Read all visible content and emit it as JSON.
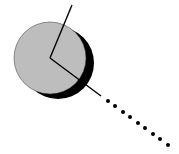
{
  "diagram": {
    "colors": {
      "background": "#ffffff",
      "disc_fill": "#bdbdbd",
      "disc_stroke": "#333333",
      "shadow": "#000000",
      "line": "#000000"
    },
    "disc": {
      "cx": 50,
      "cy": 58,
      "r": 36
    },
    "shadow": {
      "cx": 58,
      "cy": 63,
      "r": 36
    },
    "solid_line_up": {
      "x1": 50,
      "y1": 58,
      "x2": 72,
      "y2": 5
    },
    "solid_line_down": {
      "x1": 50,
      "y1": 58,
      "x2": 101,
      "y2": 96
    },
    "dots": [
      [
        108,
        101
      ],
      [
        115,
        106
      ],
      [
        123,
        112
      ],
      [
        130,
        117
      ],
      [
        138,
        123
      ],
      [
        145,
        128
      ],
      [
        153,
        134
      ],
      [
        160,
        139
      ],
      [
        168,
        145
      ]
    ],
    "dot_radius": 2
  }
}
